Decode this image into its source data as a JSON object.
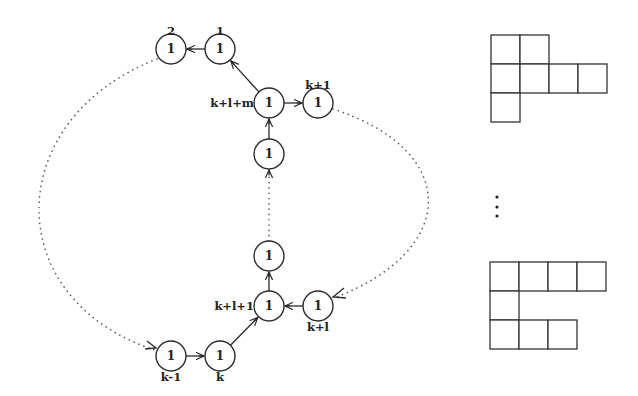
{
  "graph": {
    "node_value": "1",
    "nodes": [
      {
        "id": "n2",
        "x": 171,
        "y": 49,
        "value": "1",
        "label": "2",
        "label_pos": "above"
      },
      {
        "id": "n1",
        "x": 220,
        "y": 49,
        "value": "1",
        "label": "1",
        "label_pos": "above"
      },
      {
        "id": "nklm",
        "x": 269,
        "y": 103,
        "value": "1",
        "label": "k+l+m",
        "label_pos": "left"
      },
      {
        "id": "nk1top",
        "x": 318,
        "y": 103,
        "value": "1",
        "label": "k+1",
        "label_pos": "above"
      },
      {
        "id": "nmid1",
        "x": 269,
        "y": 154,
        "value": "1",
        "label": "",
        "label_pos": "none"
      },
      {
        "id": "nmid2",
        "x": 269,
        "y": 256,
        "value": "1",
        "label": "",
        "label_pos": "none"
      },
      {
        "id": "nkl1",
        "x": 269,
        "y": 306,
        "value": "1",
        "label": "k+l+1",
        "label_pos": "left"
      },
      {
        "id": "nkl",
        "x": 318,
        "y": 306,
        "value": "1",
        "label": "k+l",
        "label_pos": "below"
      },
      {
        "id": "nkm1",
        "x": 171,
        "y": 356,
        "value": "1",
        "label": "k-1",
        "label_pos": "below"
      },
      {
        "id": "nk",
        "x": 220,
        "y": 356,
        "value": "1",
        "label": "k",
        "label_pos": "below"
      }
    ],
    "edges": [
      {
        "from": "n1",
        "to": "n2",
        "style": "solid"
      },
      {
        "from": "nklm",
        "to": "n1",
        "style": "solid"
      },
      {
        "from": "nklm",
        "to": "nk1top",
        "style": "solid"
      },
      {
        "from": "nmid1",
        "to": "nklm",
        "style": "solid"
      },
      {
        "from": "nmid2",
        "to": "nmid1",
        "style": "dotted"
      },
      {
        "from": "nkl1",
        "to": "nmid2",
        "style": "solid"
      },
      {
        "from": "nkl",
        "to": "nkl1",
        "style": "solid"
      },
      {
        "from": "nk",
        "to": "nkl1",
        "style": "solid"
      },
      {
        "from": "nkm1",
        "to": "nk",
        "style": "solid"
      },
      {
        "from": "n2",
        "to": "nkm1",
        "style": "dotted-curve-left"
      },
      {
        "from": "nk1top",
        "to": "nkl",
        "style": "dotted-curve-right"
      }
    ]
  },
  "young_diagrams": {
    "top": {
      "row_lengths": [
        2,
        4,
        1
      ],
      "cell_size": 29,
      "origin": [
        491,
        35
      ]
    },
    "ellipsis": "⋮",
    "bottom": {
      "row_lengths": [
        4,
        1,
        3
      ],
      "cell_size": 29,
      "origin": [
        490,
        262
      ]
    }
  }
}
